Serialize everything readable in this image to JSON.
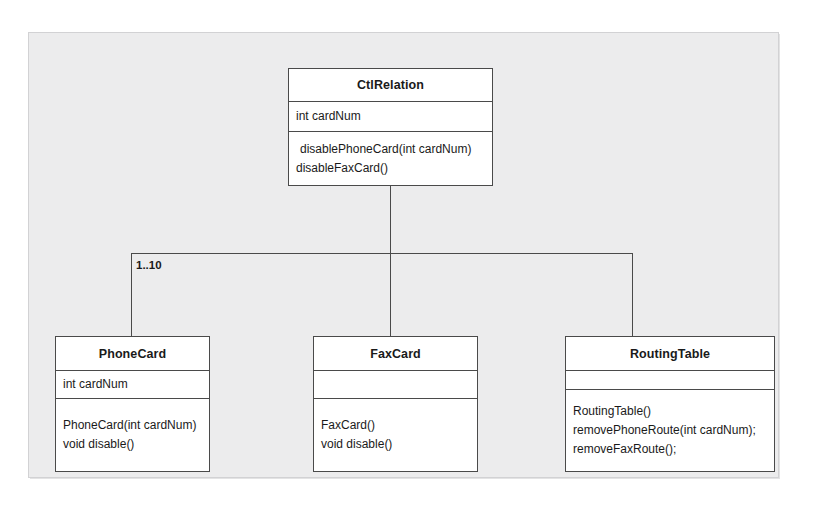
{
  "diagram": {
    "kind": "uml-class-diagram",
    "background_color": "#ececed",
    "line_color": "#4a4a4a",
    "box_fill": "#ffffff",
    "classes": [
      {
        "id": "ctl-relation",
        "name": "CtlRelation",
        "attributes": [
          "int cardNum"
        ],
        "operations": [
          "disablePhoneCard(int cardNum)",
          "disableFaxCard()"
        ]
      },
      {
        "id": "phone-card",
        "name": "PhoneCard",
        "attributes": [
          "int cardNum"
        ],
        "operations": [
          "PhoneCard(int cardNum)",
          "void disable()"
        ]
      },
      {
        "id": "fax-card",
        "name": "FaxCard",
        "attributes": [],
        "operations": [
          "FaxCard()",
          "void disable()"
        ]
      },
      {
        "id": "routing-table",
        "name": "RoutingTable",
        "attributes": [],
        "operations": [
          "RoutingTable()",
          "removePhoneRoute(int cardNum);",
          "removeFaxRoute();"
        ]
      }
    ],
    "associations": [
      {
        "id": "ctl-relation-to-phone-card",
        "from": "CtlRelation",
        "to": "PhoneCard",
        "multiplicity": "1..10"
      },
      {
        "id": "ctl-relation-to-fax-card",
        "from": "CtlRelation",
        "to": "FaxCard",
        "multiplicity": ""
      },
      {
        "id": "ctl-relation-to-routing-table",
        "from": "CtlRelation",
        "to": "RoutingTable",
        "multiplicity": ""
      }
    ]
  }
}
